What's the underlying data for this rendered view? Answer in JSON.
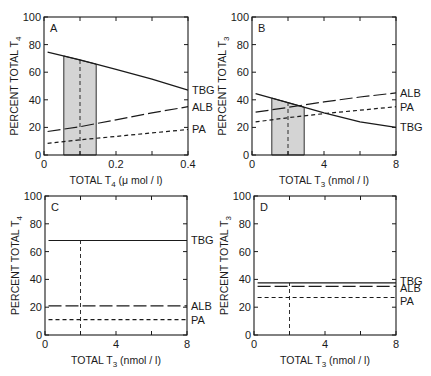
{
  "colors": {
    "ink": "#1a1a1a",
    "shade": "#d4d4d4",
    "background": "#ffffff"
  },
  "chart_data": [
    {
      "panel": "A",
      "type": "line",
      "xlabel": "TOTAL T4 (μmol / l)",
      "xlabel_main": "TOTAL T",
      "xlabel_sub": "4",
      "xlabel_unit": " (μ mol / l)",
      "ylabel_main": "PERCENT TOTAL T",
      "ylabel_sub": "4",
      "xlim": [
        0,
        0.4
      ],
      "ylim": [
        0,
        100
      ],
      "xticks": [
        0,
        0.2,
        0.4
      ],
      "xtick_labels": [
        "0",
        "0.2",
        "0.4"
      ],
      "xminor": [
        0.1,
        0.3
      ],
      "yticks": [
        0,
        20,
        40,
        60,
        80,
        100
      ],
      "shaded_range": [
        0.055,
        0.145
      ],
      "reference_x": 0.1,
      "series": [
        {
          "name": "TBG",
          "style": "solid",
          "x": [
            0.01,
            0.1,
            0.2,
            0.3,
            0.4
          ],
          "values": [
            74.5,
            69,
            62,
            55,
            47
          ]
        },
        {
          "name": "ALB",
          "style": "longdash",
          "x": [
            0.01,
            0.1,
            0.2,
            0.3,
            0.4
          ],
          "values": [
            17,
            20.5,
            25.5,
            30.5,
            35
          ]
        },
        {
          "name": "PA",
          "style": "shortdash",
          "x": [
            0.01,
            0.1,
            0.2,
            0.3,
            0.4
          ],
          "values": [
            8.5,
            11,
            13.5,
            16,
            18.5
          ]
        }
      ],
      "frame": {
        "left": 44,
        "top": 17,
        "right": 188,
        "bottom": 155
      }
    },
    {
      "panel": "B",
      "type": "line",
      "xlabel": "TOTAL T3 (nmol / l)",
      "xlabel_main": "TOTAL T",
      "xlabel_sub": "3",
      "xlabel_unit": " (nmol / l)",
      "ylabel_main": "PERCENT TOTAL T",
      "ylabel_sub": "3",
      "xlim": [
        0,
        8
      ],
      "ylim": [
        0,
        100
      ],
      "xticks": [
        0,
        4,
        8
      ],
      "xtick_labels": [
        "0",
        "4",
        "8"
      ],
      "xminor": [
        2,
        6
      ],
      "yticks": [
        0,
        20,
        40,
        60,
        80,
        100
      ],
      "shaded_range": [
        1.1,
        2.9
      ],
      "reference_x": 2.0,
      "series": [
        {
          "name": "ALB",
          "style": "longdash",
          "x": [
            0.2,
            2,
            4,
            6,
            8
          ],
          "values": [
            31,
            34.5,
            38.5,
            42,
            45
          ]
        },
        {
          "name": "PA",
          "style": "shortdash",
          "x": [
            0.2,
            2,
            4,
            6,
            8
          ],
          "values": [
            24,
            27,
            30,
            32.5,
            35
          ]
        },
        {
          "name": "TBG",
          "style": "solid",
          "x": [
            0.2,
            2,
            4,
            6,
            8
          ],
          "values": [
            44.5,
            38,
            30.5,
            24,
            20
          ]
        }
      ],
      "frame": {
        "left": 252,
        "top": 17,
        "right": 396,
        "bottom": 155
      }
    },
    {
      "panel": "C",
      "type": "line",
      "xlabel": "TOTAL T3 (nmol / l)",
      "xlabel_main": "TOTAL T",
      "xlabel_sub": "3",
      "xlabel_unit": " (nmol / l)",
      "ylabel_main": "PERCENT TOTAL T",
      "ylabel_sub": "4",
      "xlim": [
        0,
        8
      ],
      "ylim": [
        0,
        100
      ],
      "xticks": [
        0,
        4,
        8
      ],
      "xtick_labels": [
        "0",
        "4",
        "8"
      ],
      "xminor": [
        2,
        6
      ],
      "yticks": [
        0,
        20,
        40,
        60,
        80,
        100
      ],
      "shaded_range": null,
      "reference_x": 2.0,
      "reference_top": 68,
      "series": [
        {
          "name": "TBG",
          "style": "solid",
          "x": [
            0.2,
            8
          ],
          "values": [
            68,
            68
          ]
        },
        {
          "name": "ALB",
          "style": "longdash",
          "x": [
            0.2,
            8
          ],
          "values": [
            21,
            21
          ]
        },
        {
          "name": "PA",
          "style": "shortdash",
          "x": [
            0.2,
            8
          ],
          "values": [
            11,
            11
          ]
        }
      ],
      "frame": {
        "left": 45,
        "top": 196,
        "right": 187,
        "bottom": 335
      }
    },
    {
      "panel": "D",
      "type": "line",
      "xlabel": "TOTAL T3 (nmol / l)",
      "xlabel_main": "TOTAL T",
      "xlabel_sub": "3",
      "xlabel_unit": " (nmol / l)",
      "ylabel_main": "PERCENT TOTAL T",
      "ylabel_sub": "3",
      "xlim": [
        0,
        8
      ],
      "ylim": [
        0,
        100
      ],
      "xticks": [
        0,
        4,
        8
      ],
      "xtick_labels": [
        "0",
        "4",
        "8"
      ],
      "xminor": [
        2,
        6
      ],
      "yticks": [
        0,
        20,
        40,
        60,
        80,
        100
      ],
      "shaded_range": null,
      "reference_x": 2.0,
      "reference_top": 37.5,
      "series": [
        {
          "name": "TBG",
          "style": "solid",
          "x": [
            0.2,
            8
          ],
          "values": [
            37.5,
            37.5
          ]
        },
        {
          "name": "ALB",
          "style": "longdash",
          "x": [
            0.2,
            8
          ],
          "values": [
            35,
            35
          ]
        },
        {
          "name": "PA",
          "style": "shortdash",
          "x": [
            0.2,
            8
          ],
          "values": [
            27,
            27
          ]
        }
      ],
      "frame": {
        "left": 254,
        "top": 196,
        "right": 396,
        "bottom": 335
      }
    }
  ],
  "label_offsets": {
    "A": {
      "TBG": 0,
      "ALB": 0,
      "PA": 0
    },
    "B": {
      "ALB": 0,
      "PA": 0,
      "TBG": 0
    },
    "C": {
      "TBG": 0,
      "ALB": 0,
      "PA": 0
    },
    "D": {
      "TBG": -2,
      "ALB": 2,
      "PA": 4
    }
  }
}
